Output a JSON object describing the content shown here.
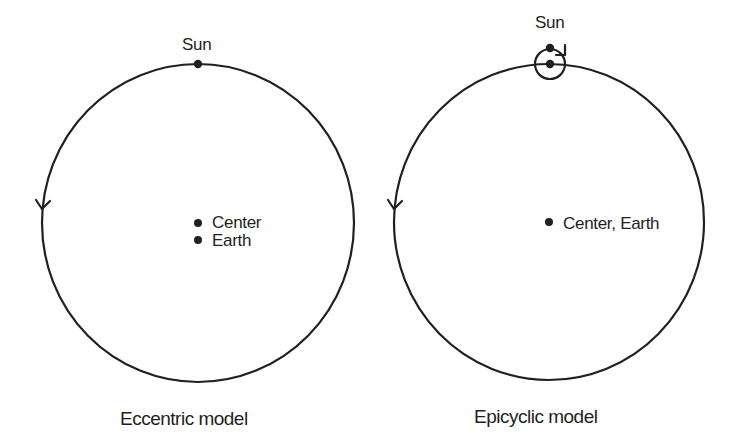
{
  "diagrams": [
    {
      "caption": "Eccentric model",
      "labels": {
        "sun": "Sun",
        "center": "Center",
        "earth": "Earth"
      },
      "direction_arrow": "counterclockwise"
    },
    {
      "caption": "Epicyclic model",
      "labels": {
        "sun": "Sun",
        "center_earth": "Center, Earth"
      },
      "direction_arrow": "counterclockwise",
      "epicycle_arrow": "clockwise"
    }
  ],
  "colors": {
    "stroke": "#231f20",
    "background": "#ffffff"
  }
}
